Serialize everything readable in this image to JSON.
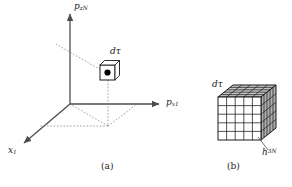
{
  "figure": {
    "background_color": "#ffffff",
    "line_color": "#4d4d4d",
    "grid_color": "#1a1a1a",
    "shade_color": "#b3b3b3",
    "dot_color": "#000000",
    "panels": [
      {
        "id": "a",
        "caption": "(a)",
        "kind": "phase-space-axes",
        "axes": [
          {
            "name": "vertical",
            "label_text": "p",
            "label_sub": "zN",
            "label_sup": ""
          },
          {
            "name": "horizontal",
            "label_text": "p",
            "label_sub": "x1",
            "label_sup": ""
          },
          {
            "name": "depth",
            "label_text": "x",
            "label_sub": "1",
            "label_sup": ""
          }
        ],
        "volume_element": {
          "label_text": "d",
          "label_sym": "τ"
        },
        "has_projection_lines": true,
        "has_state_point": true
      },
      {
        "id": "b",
        "caption": "(b)",
        "kind": "subdivided-cube",
        "volume_element": {
          "label_text": "d",
          "label_sym": "τ"
        },
        "cell_label": {
          "label_text": "h",
          "label_sup": "3N"
        },
        "grid_divisions": 5
      }
    ]
  },
  "labels": {
    "axis_vertical_base": "p",
    "axis_vertical_sub": "zN",
    "axis_horizontal_base": "p",
    "axis_horizontal_sub": "x1",
    "axis_depth_base": "x",
    "axis_depth_sub": "1",
    "dtau_base": "d",
    "dtau_symbol": "τ",
    "h_base": "h",
    "h_sup": "3N",
    "caption_a": "(a)",
    "caption_b": "(b)"
  }
}
